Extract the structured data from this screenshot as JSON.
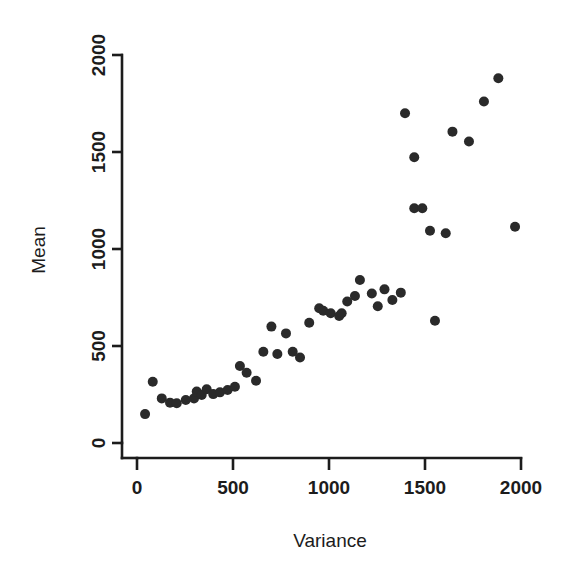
{
  "chart_data": {
    "type": "scatter",
    "title": "",
    "xlabel": "Variance",
    "ylabel": "Mean",
    "xlim": [
      -60,
      2120
    ],
    "ylim": [
      -110,
      2080
    ],
    "xticks": [
      0,
      500,
      1000,
      1500,
      2000
    ],
    "yticks": [
      0,
      500,
      1000,
      1500,
      2000
    ],
    "xtick_labels": [
      "0",
      "500",
      "1000",
      "1500",
      "2000"
    ],
    "ytick_labels": [
      "0",
      "500",
      "1000",
      "1500",
      "2000"
    ],
    "grid": false,
    "legend": null,
    "marker": "filled-circle",
    "marker_color": "#2a2a2a",
    "marker_size": 5,
    "series": [
      {
        "name": "samples",
        "points": [
          [
            42,
            149
          ],
          [
            82,
            316
          ],
          [
            129,
            230
          ],
          [
            172,
            208
          ],
          [
            207,
            205
          ],
          [
            254,
            222
          ],
          [
            297,
            230
          ],
          [
            311,
            265
          ],
          [
            337,
            247
          ],
          [
            363,
            277
          ],
          [
            397,
            252
          ],
          [
            432,
            261
          ],
          [
            472,
            273
          ],
          [
            510,
            290
          ],
          [
            536,
            397
          ],
          [
            571,
            362
          ],
          [
            620,
            321
          ],
          [
            658,
            470
          ],
          [
            700,
            600
          ],
          [
            731,
            459
          ],
          [
            776,
            565
          ],
          [
            811,
            470
          ],
          [
            849,
            441
          ],
          [
            897,
            620
          ],
          [
            949,
            695
          ],
          [
            970,
            682
          ],
          [
            1009,
            669
          ],
          [
            1053,
            655
          ],
          [
            1066,
            669
          ],
          [
            1095,
            729
          ],
          [
            1135,
            758
          ],
          [
            1161,
            840
          ],
          [
            1223,
            771
          ],
          [
            1254,
            705
          ],
          [
            1289,
            792
          ],
          [
            1330,
            737
          ],
          [
            1374,
            775
          ],
          [
            1396,
            1700
          ],
          [
            1444,
            1473
          ],
          [
            1444,
            1210
          ],
          [
            1486,
            1210
          ],
          [
            1526,
            1094
          ],
          [
            1552,
            630
          ],
          [
            1608,
            1081
          ],
          [
            1643,
            1605
          ],
          [
            1729,
            1554
          ],
          [
            1807,
            1760
          ],
          [
            1882,
            1880
          ],
          [
            1969,
            1115
          ]
        ]
      }
    ]
  },
  "axes": {
    "x_axis_name": "variance-axis",
    "y_axis_name": "mean-axis"
  }
}
